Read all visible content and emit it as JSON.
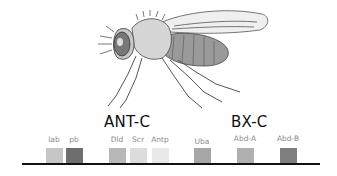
{
  "figure": {
    "illustration": "drosophila-fly",
    "clusters": [
      {
        "label": "ANT-C",
        "x": 104,
        "y": 113
      },
      {
        "label": "BX-C",
        "x": 231,
        "y": 113
      }
    ],
    "genes": [
      {
        "label": "lab",
        "box_x": 46,
        "color": "#c6c6c6"
      },
      {
        "label": "pb",
        "box_x": 66,
        "color": "#6e6e6e"
      },
      {
        "label": "Dld",
        "box_x": 109,
        "color": "#b8b8b8"
      },
      {
        "label": "Scr",
        "box_x": 130,
        "color": "#dcdcdc"
      },
      {
        "label": "Antp",
        "box_x": 152,
        "color": "#e8e8e8"
      },
      {
        "label": "Uba",
        "box_x": 194,
        "color": "#a6a6a6"
      },
      {
        "label": "Abd-A",
        "box_x": 237,
        "color": "#b0b0b0"
      },
      {
        "label": "Abd-B",
        "box_x": 280,
        "color": "#7e7e7e"
      }
    ],
    "chromosome_color": "#111111"
  }
}
